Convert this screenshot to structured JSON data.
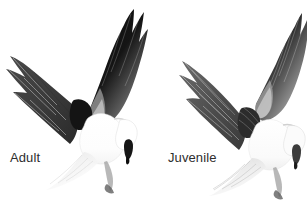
{
  "plate": {
    "background_color": "#ffffff",
    "width": 307,
    "height": 224,
    "subject": "white-tailed-kite-in-flight-comparison",
    "label_color": "#2e2e2e"
  },
  "figures": [
    {
      "id": "adult",
      "label": "Adult",
      "position": "left",
      "description_name": "adult-kite-in-flight",
      "plumage": {
        "body_color": "#ffffff",
        "wing_upper_color": "#3a3a3a",
        "wing_tip_color": "#0d0d0d",
        "shoulder_patch_color": "#111111",
        "tail_color": "#f2f2f2",
        "eye_patch_color": "#1a1a1a"
      }
    },
    {
      "id": "juvenile",
      "label": "Juvenile",
      "position": "right",
      "description_name": "juvenile-kite-in-flight",
      "plumage": {
        "body_color": "#fbfbfb",
        "wing_upper_color": "#5a5a5a",
        "wing_tip_color": "#1e1e1e",
        "shoulder_patch_color": "#2a2a2a",
        "tail_color": "#ededed",
        "eye_patch_color": "#3a3a3a"
      }
    }
  ]
}
